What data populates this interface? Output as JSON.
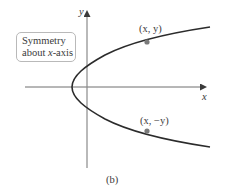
{
  "figure": {
    "caption": "(b)",
    "axes": {
      "x_label": "x",
      "y_label": "y"
    },
    "callout": {
      "line1": "Symmetry",
      "line2_prefix": "about ",
      "line2_var": "x",
      "line2_suffix": "-axis"
    },
    "points": [
      {
        "label": "(x, y)"
      },
      {
        "label": "(x, −y)"
      }
    ],
    "colors": {
      "curve": "#2b2b2b",
      "axis": "#6f6f6f",
      "point": "#7a7a7a",
      "callout_border": "#b9b9b9",
      "text": "#3a3a3a"
    }
  }
}
